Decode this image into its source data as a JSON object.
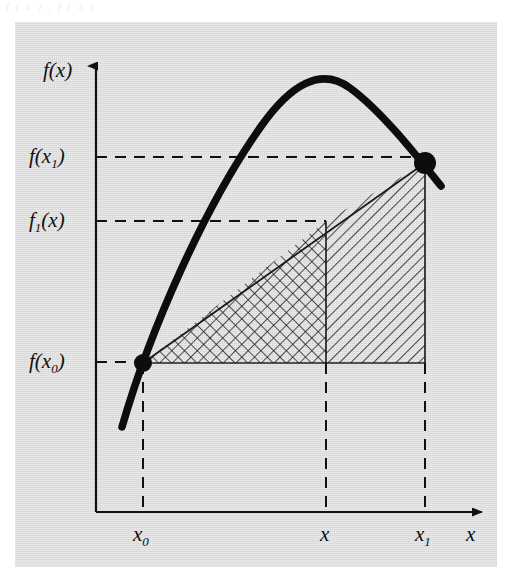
{
  "figure": {
    "top_partial_text": "f  ( x )   ,     f   ( x )",
    "background_color": "#d7d7d7",
    "ink_color": "#111111",
    "axes": {
      "y_axis_label": "f(x)",
      "x_axis_label": "x",
      "y_axis_label_name": "f-of-x",
      "x_axis_label_name": "x"
    },
    "y_ticks": [
      {
        "label_html": "f(x<sub>1</sub>)",
        "label_text": "f(x1)",
        "name": "f-x1",
        "y": 157
      },
      {
        "label_html": "f<sub>1</sub>(x)",
        "label_text": "f1(x)",
        "name": "f1-x",
        "y": 221
      },
      {
        "label_html": "f(x<sub>0</sub>)",
        "label_text": "f(x0)",
        "name": "f-x0",
        "y": 362
      }
    ],
    "x_ticks": [
      {
        "label_html": "x<sub>0</sub>",
        "label_text": "x0",
        "name": "x0",
        "x": 143
      },
      {
        "label_html": "x",
        "label_text": "x",
        "name": "x",
        "x": 326
      },
      {
        "label_html": "x<sub>1</sub>",
        "label_text": "x1",
        "name": "x1",
        "x": 425
      }
    ],
    "points": [
      {
        "name": "point-x0",
        "x": 143,
        "y": 363,
        "label": "f(x0)"
      },
      {
        "name": "point-x1",
        "x": 425,
        "y": 163,
        "label": "f(x1)"
      }
    ],
    "regions": [
      {
        "name": "crosshatch-region",
        "pattern": "crosshatch",
        "from": "x0",
        "to": "x"
      },
      {
        "name": "diagonal-hatch-region",
        "pattern": "diagonal",
        "from": "x",
        "to": "x1"
      }
    ],
    "curve": {
      "name": "function-curve",
      "type": "parabola",
      "peak_x": 310,
      "peak_y": 78
    },
    "secant": {
      "name": "secant-line",
      "from": "x0",
      "to": "x1"
    }
  },
  "chart_data": {
    "type": "line",
    "title": "",
    "xlabel": "x",
    "ylabel": "f(x)",
    "xticklabels": [
      "x0",
      "x",
      "x1"
    ],
    "yticklabels": [
      "f(x1)",
      "f1(x)",
      "f(x0)"
    ],
    "grid": false,
    "legend": "none",
    "annotations": [
      "Parabolic curve f(x) with marked points at x0 and x1",
      "Secant line through (x0, f(x0)) and (x1, f(x1))",
      "Cross-hatched triangular region between x0 and x",
      "Diagonally hatched region between x and x1"
    ],
    "series": [
      {
        "name": "f(x)",
        "x": [
          123,
          143,
          180,
          230,
          270,
          310,
          350,
          390,
          425,
          440
        ],
        "y": [
          425,
          363,
          268,
          160,
          104,
          78,
          87,
          125,
          163,
          184
        ]
      },
      {
        "name": "secant",
        "x": [
          143,
          425
        ],
        "y": [
          363,
          163
        ]
      }
    ],
    "points": [
      {
        "label": "(x0, f(x0))",
        "x": 143,
        "y": 363
      },
      {
        "label": "(x1, f(x1))",
        "x": 425,
        "y": 163
      }
    ]
  }
}
